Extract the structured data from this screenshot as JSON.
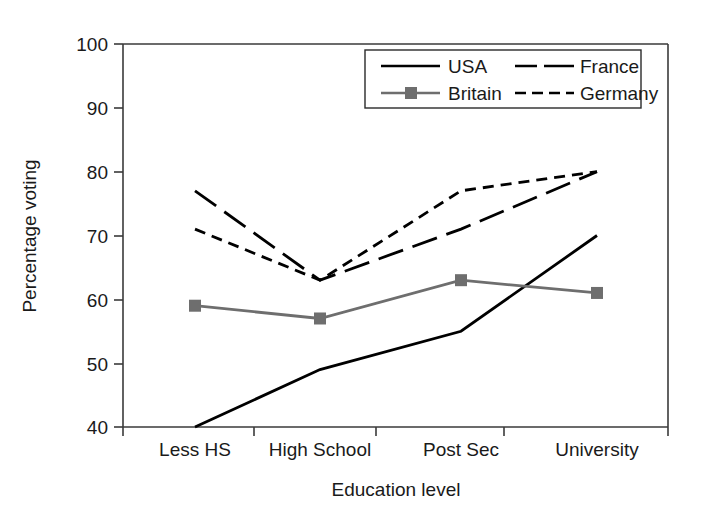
{
  "chart_data": {
    "type": "line",
    "title": "",
    "xlabel": "Education level",
    "ylabel": "Percentage voting",
    "categories": [
      "Less HS",
      "High School",
      "Post Sec",
      "University"
    ],
    "ylim": [
      40,
      100
    ],
    "yticks": [
      40,
      50,
      60,
      70,
      80,
      90,
      100
    ],
    "ytick_labels": [
      "40",
      "50",
      "60",
      "70",
      "80",
      "90",
      "100"
    ],
    "grid": false,
    "legend_position": "top-right-inside",
    "series": [
      {
        "name": "USA",
        "values": [
          40,
          49,
          55,
          70
        ],
        "color": "#000000",
        "style": "solid",
        "marker": "none"
      },
      {
        "name": "Britain",
        "values": [
          59,
          57,
          63,
          61
        ],
        "color": "#6e6e6e",
        "style": "solid",
        "marker": "square"
      },
      {
        "name": "France",
        "values": [
          77,
          63,
          71,
          80
        ],
        "color": "#000000",
        "style": "long-dash",
        "marker": "none"
      },
      {
        "name": "Germany",
        "values": [
          71,
          63,
          77,
          80
        ],
        "color": "#000000",
        "style": "short-dash",
        "marker": "none"
      }
    ]
  },
  "legend": {
    "entries": [
      {
        "label": "USA"
      },
      {
        "label": "France"
      },
      {
        "label": "Britain"
      },
      {
        "label": "Germany"
      }
    ]
  },
  "axis": {
    "y_title": "Percentage voting",
    "x_title": "Education level",
    "y_ticks": [
      "100",
      "90",
      "80",
      "70",
      "60",
      "50",
      "40"
    ],
    "x_ticks": [
      "Less HS",
      "High School",
      "Post Sec",
      "University"
    ]
  }
}
